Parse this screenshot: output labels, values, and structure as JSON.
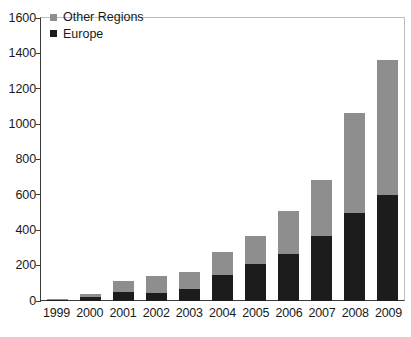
{
  "chart_data": {
    "type": "bar",
    "barmode": "stacked",
    "title": "",
    "subtitle": "",
    "xlabel": "",
    "ylabel": "",
    "categories": [
      "1999",
      "2000",
      "2001",
      "2002",
      "2003",
      "2004",
      "2005",
      "2006",
      "2007",
      "2008",
      "2009"
    ],
    "series": [
      {
        "name": "Europe",
        "color": "#1c1c1c",
        "values": [
          5,
          20,
          50,
          45,
          70,
          145,
          210,
          265,
          365,
          495,
          600
        ]
      },
      {
        "name": "Other Regions",
        "color": "#8e8e8e",
        "values": [
          5,
          20,
          65,
          95,
          95,
          130,
          160,
          245,
          320,
          570,
          760
        ]
      }
    ],
    "stack_order": [
      "Europe",
      "Other Regions"
    ],
    "totals": [
      10,
      40,
      115,
      140,
      165,
      275,
      370,
      510,
      685,
      1065,
      1360
    ],
    "ylim": [
      0,
      1600
    ],
    "ytick_values": [
      0,
      200,
      400,
      600,
      800,
      1000,
      1200,
      1400,
      1600
    ],
    "ytick_labels": [
      "0",
      "200",
      "400",
      "600",
      "800",
      "1000",
      "1200",
      "1400",
      "1600"
    ],
    "grid": false,
    "legend_position": "top-left",
    "legend_entries": [
      {
        "label": "Other Regions",
        "color": "#8e8e8e"
      },
      {
        "label": "Europe",
        "color": "#1c1c1c"
      }
    ]
  }
}
